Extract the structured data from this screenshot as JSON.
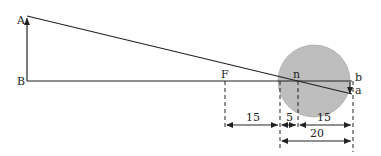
{
  "diagram": {
    "points": {
      "A": "A",
      "B": "B",
      "F": "F",
      "n": "n",
      "b": "b",
      "a": "a"
    },
    "dimensions": {
      "F_to_cornea": "15",
      "cornea_to_n": "5",
      "n_to_retina": "15",
      "cornea_to_retina": "20"
    },
    "colors": {
      "eye_fill": "#bdbdbd",
      "line": "#222222"
    }
  }
}
